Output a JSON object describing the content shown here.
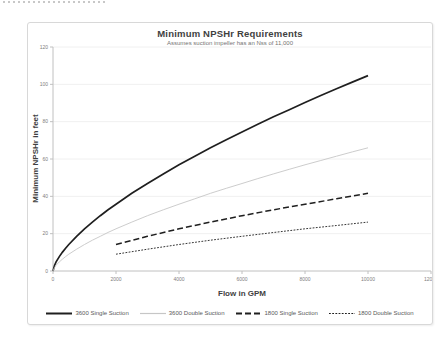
{
  "chart_data": {
    "type": "line",
    "title": "Minimum NPSHr Requirements",
    "subtitle": "Assumes suction impeller has an Nss of 11,000",
    "xlabel": "Flow in GPM",
    "ylabel": "Minimum NPSHr in feet",
    "xlim": [
      0,
      12000
    ],
    "ylim": [
      0,
      120
    ],
    "x_ticks": [
      0,
      2000,
      4000,
      6000,
      8000,
      10000,
      12000
    ],
    "y_ticks": [
      0,
      20,
      40,
      60,
      80,
      100,
      120
    ],
    "grid": "horizontal-faint",
    "legend_position": "bottom",
    "colors": {
      "grid": "#f0f0f0",
      "axis": "#c0c0c0",
      "tick_label": "#808080",
      "title": "#3f3f3f",
      "subtitle": "#757575",
      "legend_text": "#595959"
    },
    "series": [
      {
        "name": "3600 Single Suction",
        "style": "solid",
        "color": "#1f1f1f",
        "width": 1.7,
        "dash": "",
        "points": [
          [
            0,
            0
          ],
          [
            50,
            3.1
          ],
          [
            100,
            4.9
          ],
          [
            200,
            7.7
          ],
          [
            300,
            10.1
          ],
          [
            400,
            12.2
          ],
          [
            500,
            14.2
          ],
          [
            750,
            18.6
          ],
          [
            1000,
            22.6
          ],
          [
            1250,
            26.2
          ],
          [
            1500,
            29.6
          ],
          [
            1750,
            32.8
          ],
          [
            2000,
            35.8
          ],
          [
            2500,
            41.6
          ],
          [
            3000,
            46.9
          ],
          [
            3500,
            52.0
          ],
          [
            4000,
            56.9
          ],
          [
            4500,
            61.5
          ],
          [
            5000,
            66.0
          ],
          [
            5500,
            70.3
          ],
          [
            6000,
            74.5
          ],
          [
            6500,
            78.6
          ],
          [
            7000,
            82.6
          ],
          [
            7500,
            86.4
          ],
          [
            8000,
            90.2
          ],
          [
            8500,
            94.0
          ],
          [
            9000,
            97.6
          ],
          [
            9500,
            101.2
          ],
          [
            10000,
            104.7
          ]
        ]
      },
      {
        "name": "3600 Double Suction",
        "style": "solid",
        "color": "#c6c6c6",
        "width": 0.9,
        "dash": "",
        "points": [
          [
            0,
            0
          ],
          [
            50,
            1.9
          ],
          [
            100,
            3.1
          ],
          [
            200,
            4.9
          ],
          [
            300,
            6.4
          ],
          [
            400,
            7.7
          ],
          [
            500,
            9.0
          ],
          [
            750,
            11.7
          ],
          [
            1000,
            14.2
          ],
          [
            1250,
            16.5
          ],
          [
            1500,
            18.6
          ],
          [
            1750,
            20.7
          ],
          [
            2000,
            22.6
          ],
          [
            2500,
            26.2
          ],
          [
            3000,
            29.6
          ],
          [
            3500,
            32.8
          ],
          [
            4000,
            35.8
          ],
          [
            4500,
            38.7
          ],
          [
            5000,
            41.6
          ],
          [
            5500,
            44.3
          ],
          [
            6000,
            46.9
          ],
          [
            6500,
            49.5
          ],
          [
            7000,
            52.0
          ],
          [
            7500,
            54.5
          ],
          [
            8000,
            56.9
          ],
          [
            8500,
            59.2
          ],
          [
            9000,
            61.5
          ],
          [
            9500,
            63.8
          ],
          [
            10000,
            66.0
          ]
        ]
      },
      {
        "name": "1800 Single Suction",
        "style": "dashed",
        "color": "#1f1f1f",
        "width": 1.5,
        "dash": "6,3",
        "points": [
          [
            2000,
            14.2
          ],
          [
            3000,
            18.6
          ],
          [
            4000,
            22.6
          ],
          [
            5000,
            26.2
          ],
          [
            6000,
            29.6
          ],
          [
            7000,
            32.8
          ],
          [
            8000,
            35.8
          ],
          [
            9000,
            38.7
          ],
          [
            10000,
            41.6
          ]
        ]
      },
      {
        "name": "1800 Double Suction",
        "style": "dotted",
        "color": "#1f1f1f",
        "width": 0.9,
        "dash": "1.8,1.4",
        "points": [
          [
            2000,
            9.0
          ],
          [
            3000,
            11.7
          ],
          [
            4000,
            14.2
          ],
          [
            5000,
            16.5
          ],
          [
            6000,
            18.6
          ],
          [
            7000,
            20.6
          ],
          [
            8000,
            22.6
          ],
          [
            9000,
            24.4
          ],
          [
            10000,
            26.2
          ]
        ]
      }
    ]
  }
}
